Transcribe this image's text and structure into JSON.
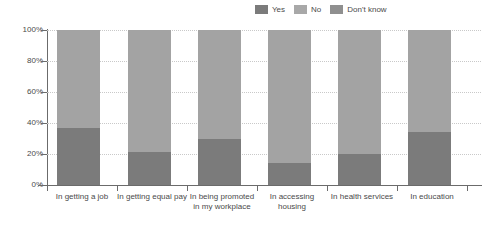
{
  "chart_data": {
    "type": "bar",
    "stacked": true,
    "orientation": "vertical",
    "title": "",
    "subtitle": "",
    "xlabel": "",
    "ylabel": "",
    "ylim": [
      0,
      100
    ],
    "yticks": [
      "0%",
      "20%",
      "40%",
      "60%",
      "80%",
      "100%"
    ],
    "ytick_values": [
      0,
      20,
      40,
      60,
      80,
      100
    ],
    "grid": "horizontal-dotted",
    "legend_position": "top-right",
    "categories": [
      "In getting a job",
      "In getting equal pay",
      "In being promoted in my workplace",
      "In accessing housing",
      "In health services",
      "In education"
    ],
    "series": [
      {
        "name": "Yes",
        "color": "#7b7b7b",
        "values": [
          37,
          21,
          30,
          14,
          20,
          34
        ]
      },
      {
        "name": "No",
        "color": "#a3a3a3",
        "values": [
          63,
          79,
          70,
          86,
          80,
          66
        ]
      },
      {
        "name": "Don't know",
        "color": "#8f8f8f",
        "values": [
          0,
          0,
          0,
          0,
          0,
          0
        ]
      }
    ]
  },
  "legend": {
    "items": [
      {
        "label": "Yes",
        "color": "#7b7b7b"
      },
      {
        "label": "No",
        "color": "#a8a8a8"
      },
      {
        "label": "Don't know",
        "color": "#8f8f8f"
      }
    ]
  },
  "axes": {
    "y": {
      "ticks": [
        {
          "label": "100%",
          "value": 100
        },
        {
          "label": "80%",
          "value": 80
        },
        {
          "label": "60%",
          "value": 60
        },
        {
          "label": "40%",
          "value": 40
        },
        {
          "label": "20%",
          "value": 20
        },
        {
          "label": "0%",
          "value": 0
        }
      ]
    },
    "x": {
      "labels": [
        "In getting a job",
        "In getting equal pay",
        "In being promoted in my workplace",
        "In accessing housing",
        "In health services",
        "In education"
      ]
    }
  },
  "colors": {
    "axis": "#6b6b6b",
    "grid": "#c9c9c9",
    "text": "#4a4a4a",
    "background": "#ffffff"
  }
}
